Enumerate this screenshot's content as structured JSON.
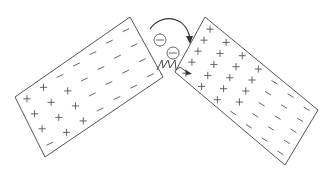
{
  "diagram": {
    "description": "Two charged plates tilted toward each other; electrons jump across the gap with a spark",
    "left_plate": {
      "label": "left-plate",
      "positive_region": "lower-left",
      "negative_region": "upper-right",
      "positive_symbol": "+",
      "negative_symbol": "−"
    },
    "right_plate": {
      "label": "right-plate",
      "positive_region": "upper-left",
      "negative_region": "lower-right",
      "positive_symbol": "+",
      "negative_symbol": "−"
    },
    "electrons": [
      {
        "symbol": "⊖"
      },
      {
        "symbol": "⊖"
      }
    ],
    "arrow": {
      "direction": "left-to-right",
      "shape": "curved-arc"
    },
    "spark": {
      "shape": "zigzag",
      "location": "gap-between-plates"
    },
    "colors": {
      "stroke": "#555555",
      "background": "#ffffff"
    }
  }
}
